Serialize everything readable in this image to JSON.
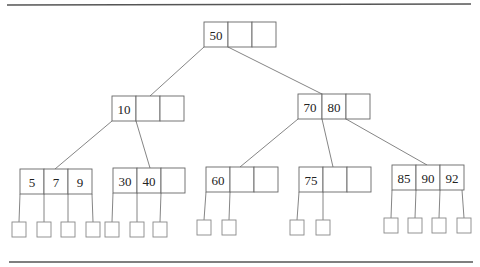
{
  "diagram": {
    "type": "B-tree",
    "cell_width": 24,
    "cell_height": 25,
    "cells_per_node": 3,
    "nodes": [
      {
        "id": "root",
        "x": 204,
        "y": 22,
        "keys": [
          "50",
          "",
          ""
        ]
      },
      {
        "id": "n10",
        "x": 112,
        "y": 96,
        "keys": [
          "10",
          "",
          ""
        ]
      },
      {
        "id": "n7080",
        "x": 298,
        "y": 94,
        "keys": [
          "70",
          "80",
          ""
        ]
      },
      {
        "id": "l579",
        "x": 20,
        "y": 169,
        "keys": [
          "5",
          "7",
          "9"
        ]
      },
      {
        "id": "l3040",
        "x": 113,
        "y": 168,
        "keys": [
          "30",
          "40",
          ""
        ]
      },
      {
        "id": "l60",
        "x": 206,
        "y": 167,
        "keys": [
          "60",
          "",
          ""
        ]
      },
      {
        "id": "l75",
        "x": 299,
        "y": 167,
        "keys": [
          "75",
          "",
          ""
        ]
      },
      {
        "id": "l859092",
        "x": 392,
        "y": 165,
        "keys": [
          "85",
          "90",
          "92"
        ]
      }
    ],
    "edges": [
      {
        "from": "root",
        "fromX": 204,
        "fromY": 47,
        "toX": 150,
        "toY": 96
      },
      {
        "from": "root",
        "fromX": 228,
        "fromY": 47,
        "toX": 322,
        "toY": 94
      },
      {
        "from": "n10",
        "fromX": 112,
        "fromY": 121,
        "toX": 55,
        "toY": 169
      },
      {
        "from": "n10",
        "fromX": 136,
        "fromY": 121,
        "toX": 150,
        "toY": 168
      },
      {
        "from": "n7080",
        "fromX": 298,
        "fromY": 119,
        "toX": 240,
        "toY": 167
      },
      {
        "from": "n7080",
        "fromX": 322,
        "fromY": 119,
        "toX": 333,
        "toY": 167
      },
      {
        "from": "n7080",
        "fromX": 346,
        "fromY": 119,
        "toX": 427,
        "toY": 165
      }
    ],
    "leaf_pointers": [
      {
        "parentX": 20,
        "parentY": 194,
        "x": 12,
        "y": 222
      },
      {
        "parentX": 44,
        "parentY": 194,
        "x": 37,
        "y": 222
      },
      {
        "parentX": 68,
        "parentY": 194,
        "x": 61,
        "y": 222
      },
      {
        "parentX": 92,
        "parentY": 194,
        "x": 86,
        "y": 222
      },
      {
        "parentX": 113,
        "parentY": 193,
        "x": 105,
        "y": 222
      },
      {
        "parentX": 137,
        "parentY": 193,
        "x": 130,
        "y": 222
      },
      {
        "parentX": 161,
        "parentY": 193,
        "x": 153,
        "y": 222
      },
      {
        "parentX": 206,
        "parentY": 192,
        "x": 197,
        "y": 220
      },
      {
        "parentX": 230,
        "parentY": 192,
        "x": 222,
        "y": 220
      },
      {
        "parentX": 299,
        "parentY": 192,
        "x": 290,
        "y": 220
      },
      {
        "parentX": 323,
        "parentY": 192,
        "x": 316,
        "y": 220
      },
      {
        "parentX": 392,
        "parentY": 190,
        "x": 384,
        "y": 218
      },
      {
        "parentX": 416,
        "parentY": 190,
        "x": 408,
        "y": 218
      },
      {
        "parentX": 440,
        "parentY": 190,
        "x": 432,
        "y": 218
      },
      {
        "parentX": 462,
        "parentY": 190,
        "x": 457,
        "y": 218
      }
    ],
    "leaf_box_size": 14,
    "rules": [
      {
        "x1": 7,
        "y1": 5,
        "x2": 471,
        "y2": 4
      },
      {
        "x1": 9,
        "y1": 262,
        "x2": 473,
        "y2": 262
      }
    ]
  }
}
